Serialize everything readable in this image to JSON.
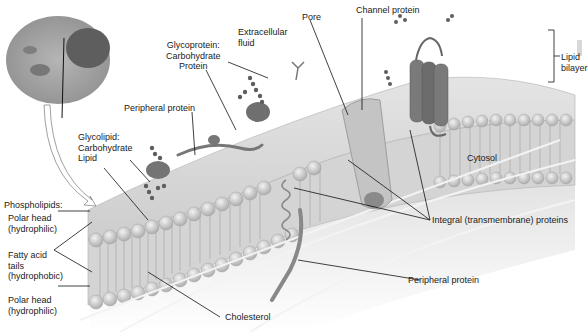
{
  "diagram": {
    "labels": {
      "glycoprotein": "Glycoprotein:\nCarbohydrate\nProtein",
      "extracellular_fluid": "Extracellular\nfluid",
      "pore": "Pore",
      "channel_protein": "Channel protein",
      "lipid_bilayer": "Lipid\nbilayer",
      "peripheral_protein_top": "Peripheral protein",
      "glycolipid": "Glycolipid:\nCarbohydrate\nLipid",
      "phospholipids": "Phospholipids:",
      "polar_head_top": "Polar head\n(hydrophilic)",
      "fatty_acid_tails": "Fatty acid\ntails\n(hydrophobic)",
      "polar_head_bottom": "Polar head\n(hydrophilic)",
      "cytosol": "Cytosol",
      "integral_proteins": "Integral (transmembrane) proteins",
      "peripheral_protein_bottom": "Peripheral protein",
      "cholesterol": "Cholesterol"
    },
    "colors": {
      "membrane_light": "#d9d9d9",
      "membrane_mid": "#bdbdbd",
      "protein_dark": "#6e6e6e",
      "leader_line": "#111111",
      "text": "#1a1a1a"
    }
  }
}
